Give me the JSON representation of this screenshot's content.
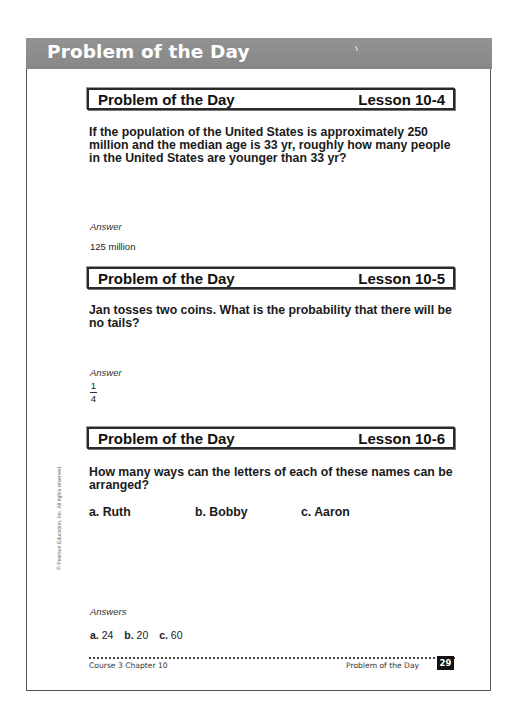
{
  "page": {
    "section_title": "Problem of the Day",
    "copyright": "© Pearson Education, Inc. All rights reserved.",
    "footer": {
      "left": "Course 3 Chapter 10",
      "right": "Problem of the Day",
      "page_number": "29"
    }
  },
  "problems": [
    {
      "header_left": "Problem of the Day",
      "lesson": "Lesson 10-4",
      "question": "If the population of the United States is approximately 250 million and the median age is 33 yr, roughly how many people in the United States are younger than 33 yr?",
      "answer_label": "Answer",
      "answer": "125 million"
    },
    {
      "header_left": "Problem of the Day",
      "lesson": "Lesson 10-5",
      "question": "Jan tosses two coins. What is the probability that there will be no tails?",
      "answer_label": "Answer",
      "answer_fraction": {
        "numerator": "1",
        "denominator": "4"
      }
    },
    {
      "header_left": "Problem of the Day",
      "lesson": "Lesson 10-6",
      "question": "How many ways can the letters of each of these names can be arranged?",
      "choices": [
        {
          "label": "a. Ruth"
        },
        {
          "label": "b. Bobby"
        },
        {
          "label": "c. Aaron"
        }
      ],
      "answer_label": "Answers",
      "answers": [
        {
          "key": "a.",
          "value": "24"
        },
        {
          "key": "b.",
          "value": "20"
        },
        {
          "key": "c.",
          "value": "60"
        }
      ]
    }
  ]
}
